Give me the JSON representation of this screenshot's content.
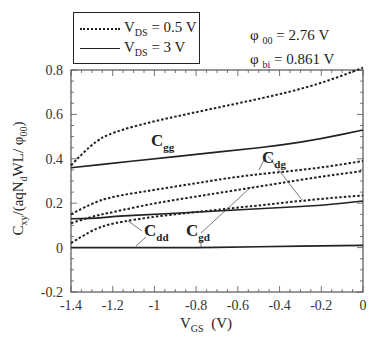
{
  "legend": {
    "items": [
      {
        "symbol": "V",
        "sub": "DS",
        "text": " = 0.5 V",
        "style": "dotted"
      },
      {
        "symbol": "V",
        "sub": "DS",
        "text": " = 3 V",
        "style": "solid"
      }
    ]
  },
  "params": [
    {
      "symbol": "φ",
      "sub": "00",
      "text": " = 2.76 V"
    },
    {
      "symbol": "φ",
      "sub": "bi",
      "text": " = 0.861 V"
    }
  ],
  "axes": {
    "xlabel_main": "V",
    "xlabel_sub": "GS",
    "xlabel_unit": "  (V)",
    "ylabel": "C_xy /(aqN_d WL/ φ_00)"
  },
  "curve_labels": [
    {
      "main": "C",
      "sub": "gg"
    },
    {
      "main": "C",
      "sub": "dg"
    },
    {
      "main": "C",
      "sub": "dd"
    },
    {
      "main": "C",
      "sub": "gd"
    }
  ],
  "chart_data": {
    "type": "line",
    "title": "",
    "xlabel": "V_GS (V)",
    "ylabel": "C_xy/(aqN_d WL/ φ_00)",
    "xlim": [
      -1.4,
      0
    ],
    "ylim": [
      -0.2,
      0.8
    ],
    "xticks": [
      -1.4,
      -1.2,
      -1,
      -0.8,
      -0.6,
      -0.4,
      -0.2,
      0
    ],
    "yticks": [
      -0.2,
      0,
      0.2,
      0.4,
      0.6,
      0.8
    ],
    "grid": false,
    "legend_position": "top-left (outside)",
    "annotations": [
      "φ_00 = 2.76 V",
      "φ_bi = 0.861 V"
    ],
    "x": [
      -1.4,
      -1.3,
      -1.2,
      -1.0,
      -0.8,
      -0.6,
      -0.4,
      -0.2,
      0
    ],
    "series": [
      {
        "name": "C_gg (V_DS = 0.5 V)",
        "style": "dotted",
        "values": [
          0.37,
          0.47,
          0.52,
          0.57,
          0.61,
          0.65,
          0.69,
          0.74,
          0.81
        ]
      },
      {
        "name": "C_gg (V_DS = 3 V)",
        "style": "solid",
        "values": [
          0.36,
          0.37,
          0.38,
          0.4,
          0.42,
          0.44,
          0.46,
          0.49,
          0.53
        ]
      },
      {
        "name": "C_dg (V_DS = 0.5 V)",
        "style": "dotted",
        "values": [
          0.15,
          0.2,
          0.23,
          0.26,
          0.29,
          0.32,
          0.34,
          0.36,
          0.39
        ]
      },
      {
        "name": "C_gd (V_DS = 0.5 V)",
        "style": "dotted",
        "values": [
          0.11,
          0.14,
          0.16,
          0.2,
          0.23,
          0.26,
          0.29,
          0.32,
          0.345
        ]
      },
      {
        "name": "C_dg / C_gd (V_DS = 3 V)",
        "style": "solid",
        "values": [
          0.13,
          0.13,
          0.14,
          0.15,
          0.16,
          0.17,
          0.18,
          0.19,
          0.21
        ]
      },
      {
        "name": "C_dd (V_DS = 0.5 V)",
        "style": "dotted",
        "values": [
          0.02,
          0.08,
          0.11,
          0.14,
          0.16,
          0.18,
          0.2,
          0.22,
          0.235
        ]
      },
      {
        "name": "C_gd (V_DS = 3 V)",
        "style": "solid",
        "values": [
          0.0,
          0.0,
          0.0,
          0.0,
          0.0,
          0.002,
          0.005,
          0.008,
          0.01
        ]
      }
    ]
  }
}
